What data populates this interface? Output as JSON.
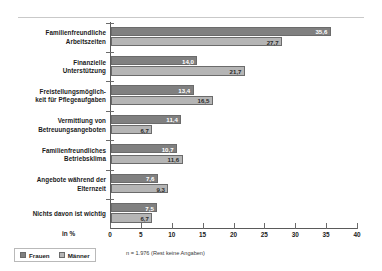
{
  "chart_data": {
    "type": "bar",
    "orientation": "horizontal",
    "title": "",
    "subtitle": "",
    "xlabel": "in %",
    "ylabel": "",
    "xlim": [
      0,
      40
    ],
    "xticks": [
      "0",
      "5",
      "10",
      "15",
      "20",
      "25",
      "30",
      "35",
      "40"
    ],
    "xtick_values": [
      0,
      5,
      10,
      15,
      20,
      25,
      30,
      35,
      40
    ],
    "grid": false,
    "legend_position": "bottom-left",
    "categories": [
      "Familienfreundliche Arbeitszeiten",
      "Finanzielle Unterstützung",
      "Freistellungsmöglich-keit für Pflegeaufgaben",
      "Vermittlung von Betreuungsangeboten",
      "Familienfreundliches Betriebsklima",
      "Angebote während der Elternzeit",
      "Nichts davon ist wichtig"
    ],
    "category_lines": [
      [
        "Familienfreundliche",
        "Arbeitszeiten"
      ],
      [
        "Finanzielle",
        "Unterstützung"
      ],
      [
        "Freistellungsmöglich-",
        "keit für Pflegeaufgaben"
      ],
      [
        "Vermittlung von",
        "Betreuungsangeboten"
      ],
      [
        "Familienfreundliches",
        "Betriebsklima"
      ],
      [
        "Angebote während der",
        "Elternzeit"
      ],
      [
        "Nichts davon ist wichtig"
      ]
    ],
    "series": [
      {
        "name": "Frauen",
        "color": "#808080",
        "values": [
          35.6,
          14.0,
          13.4,
          11.4,
          10.7,
          7.6,
          7.5
        ],
        "labels": [
          "35,6",
          "14,0",
          "13,4",
          "11,4",
          "10,7",
          "7,6",
          "7,5"
        ]
      },
      {
        "name": "Männer",
        "color": "#b5b5b5",
        "values": [
          27.7,
          21.7,
          16.5,
          6.7,
          11.6,
          9.3,
          6.7
        ],
        "labels": [
          "27,7",
          "21,7",
          "16,5",
          "6,7",
          "11,6",
          "9,3",
          "6,7"
        ]
      }
    ],
    "footnote": "n = 1.976 (Rest keine Angaben)"
  }
}
